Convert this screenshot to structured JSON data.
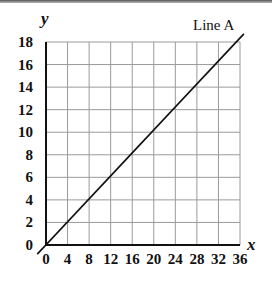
{
  "chart_data": {
    "type": "line",
    "title": "",
    "xlabel": "x",
    "ylabel": "y",
    "xlim": [
      0,
      36
    ],
    "ylim": [
      0,
      18
    ],
    "grid": true,
    "x_ticks": [
      0,
      4,
      8,
      12,
      16,
      20,
      24,
      28,
      32,
      36
    ],
    "y_ticks": [
      0,
      2,
      4,
      6,
      8,
      10,
      12,
      14,
      16,
      18
    ],
    "x_tick_labels": [
      "0",
      "4",
      "8",
      "12",
      "16",
      "20",
      "24",
      "28",
      "32",
      "36"
    ],
    "y_tick_labels": [
      "0",
      "2",
      "4",
      "6",
      "8",
      "10",
      "12",
      "14",
      "16",
      "18"
    ],
    "series": [
      {
        "name": "Line A",
        "x": [
          0,
          4,
          8,
          12,
          16,
          20,
          24,
          28,
          32,
          36
        ],
        "y": [
          0,
          2,
          4,
          6,
          8,
          10,
          12,
          14,
          16,
          18
        ],
        "color": "#111111"
      }
    ],
    "annotations": [
      {
        "text": "Line A",
        "position": "top-right, near end of line"
      }
    ],
    "legend": "none (line labeled directly)"
  },
  "labels": {
    "x_axis": "x",
    "y_axis": "y",
    "line_name": "Line A"
  },
  "colors": {
    "grid": "#9a9a9a",
    "axis": "#111111",
    "line": "#111111"
  }
}
